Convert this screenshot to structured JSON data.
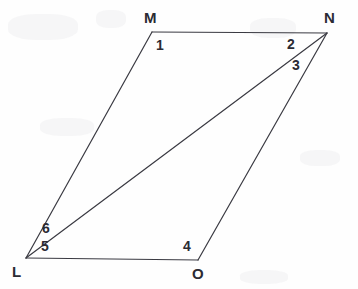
{
  "figure": {
    "name": "parallelogram-lmno-with-diagonal",
    "background_color": "#fefefe",
    "stroke_color": "#3a3a42",
    "label_color": "#2b2b33",
    "stroke_width": 1.2,
    "width": 358,
    "height": 289
  },
  "vertices": [
    {
      "id": "M",
      "label": "M",
      "x": 152,
      "y": 32,
      "label_x": 144,
      "label_y": 10
    },
    {
      "id": "N",
      "label": "N",
      "x": 327,
      "y": 33,
      "label_x": 324,
      "label_y": 10
    },
    {
      "id": "L",
      "label": "L",
      "x": 26,
      "y": 258,
      "label_x": 12,
      "label_y": 264
    },
    {
      "id": "O",
      "label": "O",
      "x": 198,
      "y": 260,
      "label_x": 192,
      "label_y": 266
    }
  ],
  "edges": [
    {
      "id": "MN",
      "from": "M",
      "to": "N"
    },
    {
      "id": "NO",
      "from": "N",
      "to": "O"
    },
    {
      "id": "OL",
      "from": "O",
      "to": "L"
    },
    {
      "id": "LM",
      "from": "L",
      "to": "M"
    },
    {
      "id": "LN",
      "from": "L",
      "to": "N",
      "role": "diagonal"
    }
  ],
  "angle_labels": [
    {
      "id": "angle-1",
      "label": "1",
      "x": 156,
      "y": 38,
      "at_vertex": "M"
    },
    {
      "id": "angle-2",
      "label": "2",
      "x": 287,
      "y": 37,
      "at_vertex": "N"
    },
    {
      "id": "angle-3",
      "label": "3",
      "x": 292,
      "y": 58,
      "at_vertex": "N"
    },
    {
      "id": "angle-4",
      "label": "4",
      "x": 183,
      "y": 239,
      "at_vertex": "O"
    },
    {
      "id": "angle-5",
      "label": "5",
      "x": 41,
      "y": 239,
      "at_vertex": "L"
    },
    {
      "id": "angle-6",
      "label": "6",
      "x": 42,
      "y": 221,
      "at_vertex": "L"
    }
  ]
}
